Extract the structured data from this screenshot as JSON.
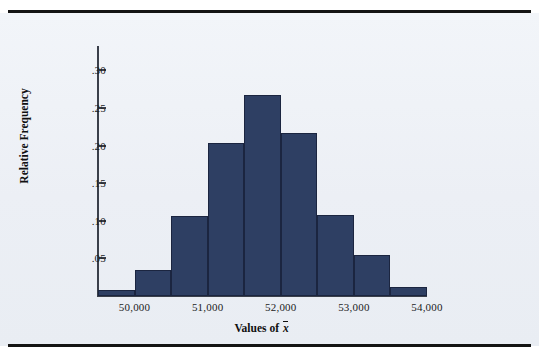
{
  "chart_data": {
    "type": "bar",
    "title": "",
    "subtitle": "",
    "xlabel": "Values of x̄",
    "ylabel": "Relative Frequency",
    "grid": false,
    "legend": null,
    "xlim": [
      49500,
      54000
    ],
    "ylim": [
      0,
      0.3325
    ],
    "bin_width": 500,
    "x_tick_values": [
      50000,
      51000,
      52000,
      53000,
      54000
    ],
    "x_tick_labels": [
      "50,000",
      "51,000",
      "52,000",
      "53,000",
      "54,000"
    ],
    "y_tick_values": [
      0.05,
      0.1,
      0.15,
      0.2,
      0.25,
      0.3
    ],
    "y_tick_labels": [
      ".05",
      ".10",
      ".15",
      ".20",
      ".25",
      ".30"
    ],
    "bin_edges": [
      49500,
      50000,
      50500,
      51000,
      51500,
      52000,
      52500,
      53000,
      53500,
      54000
    ],
    "categories": [
      "49,500-50,000",
      "50,000-50,500",
      "50,500-51,000",
      "51,000-51,500",
      "51,500-52,000",
      "52,000-52,500",
      "52,500-53,000",
      "53,000-53,500",
      "53,500-54,000"
    ],
    "values": [
      0.008,
      0.034,
      0.106,
      0.204,
      0.267,
      0.217,
      0.108,
      0.055,
      0.012
    ],
    "bar_color": "#2e3f63",
    "bar_edge_color": "#1b2540",
    "background_color": "#eef1f6",
    "axis_color": "#3a3f4a"
  },
  "figure": {
    "y_axis_title": "Relative Frequency",
    "x_axis_title_prefix": "Values of ",
    "x_axis_title_variable": "x"
  }
}
